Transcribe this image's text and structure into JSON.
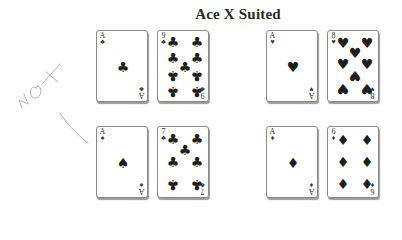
{
  "title": "Ace X Suited",
  "annotation": {
    "text": "NOT",
    "color": "#9a9a9a"
  },
  "rows": [
    {
      "pairs": [
        {
          "label": "suited",
          "cards": [
            {
              "rank": "A",
              "suit": "♣",
              "name": "ace-of-clubs"
            },
            {
              "rank": "9",
              "suit": "♣",
              "name": "nine-of-clubs"
            }
          ]
        },
        {
          "label": "suited",
          "cards": [
            {
              "rank": "A",
              "suit": "♥",
              "name": "ace-of-hearts"
            },
            {
              "rank": "8",
              "suit": "♥",
              "name": "eight-of-hearts"
            }
          ]
        }
      ]
    },
    {
      "pairs": [
        {
          "label": "not-suited",
          "cards": [
            {
              "rank": "A",
              "suit": "♠",
              "name": "ace-of-spades"
            },
            {
              "rank": "7",
              "suit": "♣",
              "name": "seven-of-clubs"
            }
          ]
        },
        {
          "label": "suited",
          "cards": [
            {
              "rank": "A",
              "suit": "♦",
              "name": "ace-of-diamonds"
            },
            {
              "rank": "6",
              "suit": "♦",
              "name": "six-of-diamonds"
            }
          ]
        }
      ]
    }
  ]
}
